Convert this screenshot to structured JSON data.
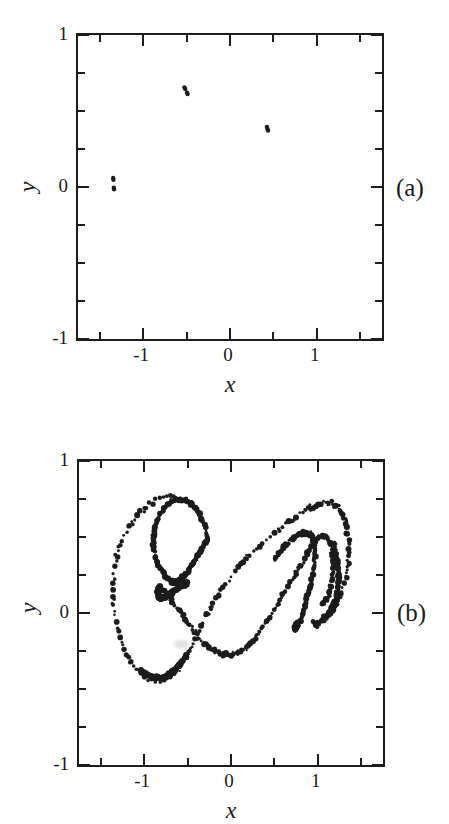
{
  "figure": {
    "background_color": "#ffffff",
    "ink_color": "#1c1c1c",
    "panels": [
      {
        "tag": "(a)",
        "x_axis_title": "x",
        "y_axis_title": "y",
        "x_ticklabels": [
          "-1",
          "0",
          "1"
        ],
        "y_ticklabels": [
          "1",
          "0",
          "-1"
        ]
      },
      {
        "tag": "(b)",
        "x_axis_title": "x",
        "y_axis_title": "y",
        "x_ticklabels": [
          "-1",
          "0",
          "1"
        ],
        "y_ticklabels": [
          "1",
          "0",
          "-1"
        ]
      }
    ]
  },
  "chart_data": [
    {
      "type": "scatter",
      "panel": "(a)",
      "title": "",
      "xlabel": "x",
      "ylabel": "y",
      "xlim": [
        -1.75,
        1.75
      ],
      "ylim": [
        -1.0,
        1.0
      ],
      "xticks": [
        -1.5,
        -1.0,
        -0.5,
        0.0,
        0.5,
        1.0,
        1.5
      ],
      "xticklabels": [
        "",
        "-1",
        "",
        "0",
        "",
        "1",
        ""
      ],
      "yticks": [
        -1.0,
        -0.75,
        -0.5,
        -0.25,
        0.0,
        0.25,
        0.5,
        0.75,
        1.0
      ],
      "yticklabels": [
        "-1",
        "",
        "",
        "",
        "0",
        "",
        "",
        "",
        "1"
      ],
      "grid": false,
      "legend": false,
      "marker_size": 2.2,
      "marker_color": "#1c1c1c",
      "points": [
        [
          -0.525,
          0.655
        ],
        [
          -0.515,
          0.645
        ],
        [
          -0.495,
          0.62
        ],
        [
          -0.488,
          0.612
        ],
        [
          0.425,
          0.395
        ],
        [
          0.432,
          0.382
        ],
        [
          0.438,
          0.372
        ],
        [
          -1.345,
          0.06
        ],
        [
          -1.342,
          0.048
        ],
        [
          -1.338,
          -0.005
        ],
        [
          -1.335,
          -0.015
        ]
      ]
    },
    {
      "type": "scatter",
      "panel": "(b)",
      "title": "",
      "xlabel": "x",
      "ylabel": "y",
      "xlim": [
        -1.75,
        1.75
      ],
      "ylim": [
        -1.0,
        1.0
      ],
      "xticks": [
        -1.5,
        -1.0,
        -0.5,
        0.0,
        0.5,
        1.0,
        1.5
      ],
      "xticklabels": [
        "",
        "-1",
        "",
        "0",
        "",
        "1",
        ""
      ],
      "yticks": [
        -1.0,
        -0.75,
        -0.5,
        -0.25,
        0.0,
        0.25,
        0.5,
        0.75,
        1.0
      ],
      "yticklabels": [
        "-1",
        "",
        "",
        "",
        "0",
        "",
        "",
        "",
        "1"
      ],
      "grid": false,
      "legend": false,
      "marker_size": 2.1,
      "marker_color": "#1c1c1c",
      "description": "Chaotic attractor: double-scroll S-shaped band with an inward spiral on the left lobe and a folded hook on the right lobe.",
      "strands": [
        {
          "name": "outer-left-loop",
          "closed": false,
          "density": 175,
          "jitter": 0.013,
          "path": [
            [
              -0.6,
              0.755
            ],
            [
              -0.72,
              0.76
            ],
            [
              -0.85,
              0.742
            ],
            [
              -0.97,
              0.7
            ],
            [
              -1.09,
              0.632
            ],
            [
              -1.19,
              0.543
            ],
            [
              -1.28,
              0.432
            ],
            [
              -1.33,
              0.318
            ],
            [
              -1.355,
              0.198
            ],
            [
              -1.352,
              0.078
            ],
            [
              -1.33,
              -0.04
            ],
            [
              -1.285,
              -0.152
            ],
            [
              -1.218,
              -0.25
            ],
            [
              -1.135,
              -0.33
            ],
            [
              -1.04,
              -0.392
            ],
            [
              -0.94,
              -0.428
            ],
            [
              -0.84,
              -0.44
            ],
            [
              -0.745,
              -0.428
            ],
            [
              -0.66,
              -0.398
            ],
            [
              -0.588,
              -0.352
            ],
            [
              -0.52,
              -0.292
            ],
            [
              -0.452,
              -0.215
            ],
            [
              -0.382,
              -0.128
            ],
            [
              -0.3,
              -0.03
            ],
            [
              -0.205,
              0.068
            ],
            [
              -0.1,
              0.16
            ],
            [
              0.01,
              0.246
            ],
            [
              0.125,
              0.326
            ],
            [
              0.245,
              0.4
            ],
            [
              0.368,
              0.468
            ],
            [
              0.492,
              0.528
            ],
            [
              0.612,
              0.58
            ],
            [
              0.728,
              0.625
            ],
            [
              0.838,
              0.665
            ],
            [
              0.94,
              0.7
            ],
            [
              1.035,
              0.722
            ],
            [
              1.122,
              0.728
            ],
            [
              1.2,
              0.715
            ],
            [
              1.262,
              0.68
            ],
            [
              1.31,
              0.62
            ],
            [
              1.34,
              0.54
            ],
            [
              1.355,
              0.448
            ],
            [
              1.352,
              0.352
            ],
            [
              1.332,
              0.262
            ],
            [
              1.298,
              0.182
            ],
            [
              1.252,
              0.112
            ],
            [
              1.198,
              0.052
            ],
            [
              1.142,
              0.005
            ],
            [
              1.088,
              -0.032
            ],
            [
              1.038,
              -0.058
            ],
            [
              0.995,
              -0.072
            ],
            [
              0.962,
              -0.072
            ],
            [
              0.938,
              -0.058
            ]
          ]
        },
        {
          "name": "inner-left-spiral",
          "closed": false,
          "density": 150,
          "jitter": 0.011,
          "path": [
            [
              -0.265,
              0.492
            ],
            [
              -0.292,
              0.545
            ],
            [
              -0.322,
              0.595
            ],
            [
              -0.358,
              0.642
            ],
            [
              -0.4,
              0.682
            ],
            [
              -0.448,
              0.714
            ],
            [
              -0.502,
              0.735
            ],
            [
              -0.56,
              0.746
            ],
            [
              -0.62,
              0.746
            ],
            [
              -0.68,
              0.735
            ],
            [
              -0.738,
              0.712
            ],
            [
              -0.79,
              0.678
            ],
            [
              -0.835,
              0.632
            ],
            [
              -0.868,
              0.578
            ],
            [
              -0.888,
              0.518
            ],
            [
              -0.893,
              0.456
            ],
            [
              -0.882,
              0.396
            ],
            [
              -0.858,
              0.342
            ],
            [
              -0.822,
              0.296
            ],
            [
              -0.778,
              0.258
            ],
            [
              -0.73,
              0.23
            ],
            [
              -0.68,
              0.212
            ],
            [
              -0.63,
              0.2
            ],
            [
              -0.582,
              0.195
            ],
            [
              -0.538,
              0.196
            ],
            [
              -0.5,
              0.2
            ]
          ]
        },
        {
          "name": "left-spiral-return",
          "closed": false,
          "density": 120,
          "jitter": 0.012,
          "path": [
            [
              -0.5,
              0.2
            ],
            [
              -0.548,
              0.186
            ],
            [
              -0.598,
              0.168
            ],
            [
              -0.648,
              0.148
            ],
            [
              -0.695,
              0.128
            ],
            [
              -0.738,
              0.112
            ],
            [
              -0.775,
              0.102
            ],
            [
              -0.805,
              0.1
            ],
            [
              -0.828,
              0.108
            ],
            [
              -0.84,
              0.124
            ],
            [
              -0.842,
              0.145
            ],
            [
              -0.832,
              0.168
            ]
          ]
        },
        {
          "name": "mid-diagonal-band",
          "closed": false,
          "density": 165,
          "jitter": 0.012,
          "path": [
            [
              -0.832,
              0.168
            ],
            [
              -0.79,
              0.15
            ],
            [
              -0.742,
              0.122
            ],
            [
              -0.69,
              0.086
            ],
            [
              -0.635,
              0.045
            ],
            [
              -0.578,
              0.0
            ],
            [
              -0.52,
              -0.046
            ],
            [
              -0.462,
              -0.092
            ],
            [
              -0.402,
              -0.136
            ],
            [
              -0.34,
              -0.176
            ],
            [
              -0.275,
              -0.212
            ],
            [
              -0.208,
              -0.24
            ],
            [
              -0.14,
              -0.262
            ],
            [
              -0.072,
              -0.274
            ],
            [
              -0.008,
              -0.276
            ],
            [
              0.055,
              -0.268
            ],
            [
              0.118,
              -0.25
            ],
            [
              0.18,
              -0.222
            ],
            [
              0.242,
              -0.186
            ],
            [
              0.305,
              -0.142
            ],
            [
              0.368,
              -0.092
            ],
            [
              0.432,
              -0.038
            ],
            [
              0.498,
              0.02
            ],
            [
              0.562,
              0.08
            ],
            [
              0.625,
              0.14
            ],
            [
              0.688,
              0.2
            ],
            [
              0.748,
              0.258
            ],
            [
              0.805,
              0.314
            ],
            [
              0.858,
              0.366
            ],
            [
              0.905,
              0.412
            ],
            [
              0.948,
              0.45
            ],
            [
              0.988,
              0.48
            ],
            [
              1.025,
              0.5
            ],
            [
              1.06,
              0.508
            ],
            [
              1.092,
              0.502
            ],
            [
              1.12,
              0.482
            ],
            [
              1.142,
              0.448
            ],
            [
              1.158,
              0.402
            ],
            [
              1.168,
              0.348
            ],
            [
              1.17,
              0.29
            ],
            [
              1.165,
              0.232
            ],
            [
              1.152,
              0.178
            ],
            [
              1.132,
              0.132
            ],
            [
              1.108,
              0.098
            ],
            [
              1.082,
              0.078
            ],
            [
              1.058,
              0.072
            ]
          ]
        },
        {
          "name": "inner-right-hook",
          "closed": false,
          "density": 140,
          "jitter": 0.011,
          "path": [
            [
              0.495,
              0.352
            ],
            [
              0.56,
              0.398
            ],
            [
              0.625,
              0.442
            ],
            [
              0.69,
              0.48
            ],
            [
              0.752,
              0.508
            ],
            [
              0.81,
              0.525
            ],
            [
              0.862,
              0.528
            ],
            [
              0.905,
              0.518
            ],
            [
              0.938,
              0.492
            ],
            [
              0.958,
              0.452
            ],
            [
              0.966,
              0.402
            ],
            [
              0.962,
              0.342
            ],
            [
              0.948,
              0.278
            ],
            [
              0.925,
              0.21
            ],
            [
              0.898,
              0.142
            ],
            [
              0.868,
              0.078
            ],
            [
              0.838,
              0.02
            ],
            [
              0.808,
              -0.028
            ],
            [
              0.782,
              -0.066
            ],
            [
              0.76,
              -0.092
            ],
            [
              0.745,
              -0.105
            ],
            [
              0.738,
              -0.105
            ],
            [
              0.742,
              -0.092
            ],
            [
              0.756,
              -0.068
            ]
          ]
        },
        {
          "name": "left-inner-core",
          "closed": false,
          "density": 110,
          "jitter": 0.01,
          "path": [
            [
              -0.268,
              0.486
            ],
            [
              -0.31,
              0.448
            ],
            [
              -0.352,
              0.408
            ],
            [
              -0.395,
              0.366
            ],
            [
              -0.438,
              0.325
            ],
            [
              -0.48,
              0.288
            ],
            [
              -0.522,
              0.256
            ],
            [
              -0.562,
              0.23
            ],
            [
              -0.6,
              0.212
            ],
            [
              -0.636,
              0.202
            ],
            [
              -0.668,
              0.2
            ],
            [
              -0.695,
              0.206
            ]
          ]
        },
        {
          "name": "right-outer-fold",
          "closed": false,
          "density": 95,
          "jitter": 0.015,
          "path": [
            [
              1.168,
              0.462
            ],
            [
              1.196,
              0.412
            ],
            [
              1.218,
              0.358
            ],
            [
              1.232,
              0.3
            ],
            [
              1.238,
              0.242
            ],
            [
              1.236,
              0.186
            ],
            [
              1.226,
              0.134
            ],
            [
              1.208,
              0.088
            ],
            [
              1.186,
              0.05
            ],
            [
              1.162,
              0.022
            ],
            [
              1.14,
              0.005
            ],
            [
              1.122,
              -0.002
            ]
          ]
        },
        {
          "name": "bottom-left-underside",
          "closed": false,
          "density": 90,
          "jitter": 0.012,
          "path": [
            [
              -1.04,
              -0.382
            ],
            [
              -0.95,
              -0.412
            ],
            [
              -0.86,
              -0.425
            ],
            [
              -0.772,
              -0.418
            ],
            [
              -0.692,
              -0.395
            ],
            [
              -0.62,
              -0.36
            ],
            [
              -0.556,
              -0.316
            ],
            [
              -0.498,
              -0.266
            ]
          ]
        }
      ],
      "smudges": [
        {
          "x": -0.565,
          "y": -0.205,
          "w": 15,
          "h": 9
        }
      ]
    }
  ]
}
